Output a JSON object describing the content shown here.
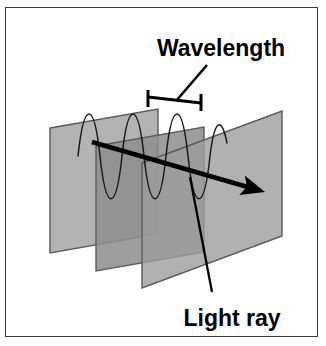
{
  "figure": {
    "title_absent": true,
    "background_color": "#ffffff",
    "border_color": "#3a3a3a",
    "labels": {
      "wavelength": "Wavelength",
      "light_ray": "Light ray"
    },
    "colors": {
      "plane_light": "#a8a8a8",
      "plane_mid": "#989898",
      "plane_dark": "#787878",
      "plane_edge": "#5a5a5a",
      "ray": "#000000",
      "wave": "#1a1a1a",
      "bracket": "#000000",
      "label_text": "#000000",
      "leader_line": "#000000"
    },
    "geometry": {
      "planes": [
        {
          "name": "back-plane",
          "points": "50,128 158,109 158,234 50,253",
          "fill": "#a8a8a8",
          "opacity": 0.88
        },
        {
          "name": "middle-plane",
          "points": "96,146 204,127 204,252 96,271",
          "fill": "#989898",
          "opacity": 0.85
        },
        {
          "name": "front-plane",
          "points": "142,163 282,111 282,236 142,288",
          "fill": "#a0a0a0",
          "opacity": 0.82
        }
      ],
      "wave": {
        "description": "sine wave with three crests crossing the planes",
        "path": "M 78,156 C 84,100 94,100 100,156 C 106,213 116,213 122,156 C 128,100 138,100 144,156 C 150,213 160,213 166,156 C 172,100 182,100 188,156 C 194,213 204,213 210,156 C 214,120 220,112 226,140",
        "stroke": "#1a1a1a",
        "stroke_width": 1.4
      },
      "ray": {
        "start": [
          92,
          142
        ],
        "end": [
          263,
          192
        ],
        "stroke": "#000000",
        "stroke_width": 4.5,
        "arrowhead": true
      },
      "bracket": {
        "left_tick_x": 147,
        "right_tick_x": 201,
        "tick_top_y": 90,
        "tick_bottom_y": 106,
        "bar_y": 98,
        "stroke_width": 3
      },
      "leaders": [
        {
          "name": "wavelength-leader",
          "from": [
            207,
            66
          ],
          "to": [
            177,
            101
          ]
        },
        {
          "name": "light-ray-leader",
          "from": [
            211,
            291
          ],
          "to": [
            190,
            178
          ]
        }
      ],
      "label_positions": {
        "wavelength": {
          "x": 220,
          "y": 55,
          "anchor": "middle",
          "font_size": 22
        },
        "light_ray": {
          "x": 232,
          "y": 325,
          "anchor": "middle",
          "font_size": 22
        }
      }
    }
  }
}
